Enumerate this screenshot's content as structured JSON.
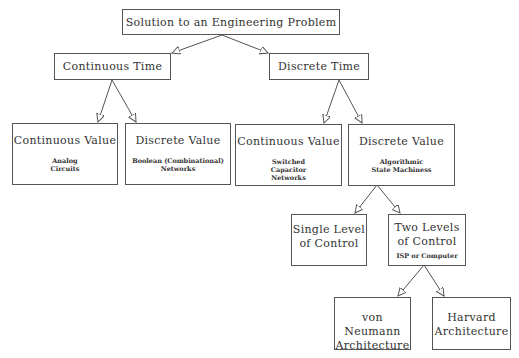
{
  "diagram": {
    "root": {
      "title": "Solution to an Engineering Problem"
    },
    "continuous_time": {
      "title": "Continuous Time"
    },
    "discrete_time": {
      "title": "Discrete Time"
    },
    "ct_continuous_value": {
      "title": "Continuous Value",
      "sub": [
        "Analog",
        "Circuits"
      ]
    },
    "ct_discrete_value": {
      "title": "Discrete Value",
      "sub": [
        "Boolean (Combinational)",
        "Networks"
      ]
    },
    "dt_continuous_value": {
      "title": "Continuous Value",
      "sub": [
        "Switched",
        "Capacitor",
        "Networks"
      ]
    },
    "dt_discrete_value": {
      "title": "Discrete Value",
      "sub": [
        "Algorithmic",
        "State Machiness"
      ]
    },
    "single_level": {
      "title": [
        "Single Level",
        "of Control"
      ]
    },
    "two_levels": {
      "title": [
        "Two Levels",
        "of Control"
      ],
      "sub": "ISP or Computer"
    },
    "von_neumann": {
      "title": [
        "von Neumann",
        "Architecture"
      ]
    },
    "harvard": {
      "title": [
        "Harvard",
        "Architecture"
      ]
    }
  },
  "colors": {
    "line": "#555555",
    "text": "#333333",
    "background": "#ffffff"
  }
}
